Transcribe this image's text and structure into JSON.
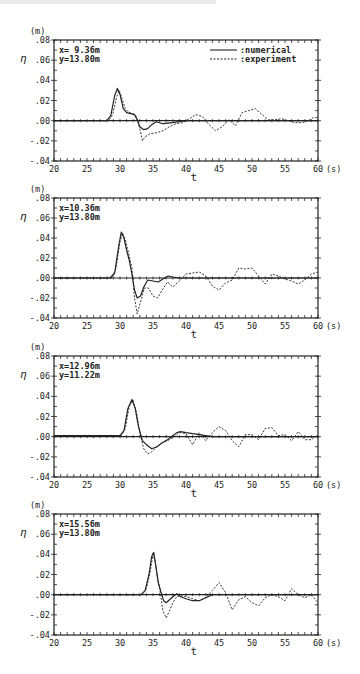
{
  "chart_data": [
    {
      "type": "line",
      "panel": 1,
      "annotation": [
        "x= 9.36m",
        "y=13.80m"
      ],
      "ylabel": "η",
      "yunit": "(m)",
      "xlabel": "t",
      "xunit": "(s)",
      "xlim": [
        20,
        60
      ],
      "ylim": [
        -0.04,
        0.08
      ],
      "xticks": [
        20,
        25,
        30,
        35,
        40,
        45,
        50,
        55,
        60
      ],
      "ytick_labels": [
        ".08",
        ".06",
        ".04",
        ".02",
        ".00",
        "-.02",
        "-.04"
      ],
      "yticks": [
        0.08,
        0.06,
        0.04,
        0.02,
        0.0,
        -0.02,
        -0.04
      ],
      "legend": [
        {
          "label": ":numerical",
          "style": "solid"
        },
        {
          "label": ":experiment",
          "style": "dashed"
        }
      ],
      "legend_position": "upper right",
      "series": [
        {
          "name": "numerical",
          "style": "solid",
          "x": [
            20,
            28,
            28.6,
            29.2,
            29.6,
            30.0,
            30.5,
            31.0,
            31.6,
            32.2,
            32.6,
            33.0,
            33.6,
            34.2,
            34.8,
            35.5,
            36.5,
            38,
            40,
            42,
            44,
            46,
            48,
            50,
            52,
            54,
            56,
            58,
            60
          ],
          "y": [
            0.0,
            0.0,
            0.005,
            0.025,
            0.032,
            0.026,
            0.012,
            0.008,
            0.007,
            0.006,
            0.001,
            -0.006,
            -0.009,
            -0.008,
            -0.004,
            -0.001,
            -0.003,
            -0.002,
            0.0,
            0.0,
            0.0,
            0.0,
            0.0,
            0.0,
            0.0,
            0.0,
            0.0,
            0.0,
            0.0
          ]
        },
        {
          "name": "experiment",
          "style": "dashed",
          "x": [
            20,
            28.3,
            28.9,
            29.5,
            29.9,
            30.3,
            30.8,
            31.4,
            32.0,
            32.5,
            33.0,
            33.4,
            33.8,
            34.5,
            35.5,
            36.5,
            37.5,
            38.5,
            39.5,
            40.5,
            41.5,
            42.5,
            43.5,
            44.5,
            45.5,
            46.5,
            47.5,
            48.5,
            49.5,
            50.5,
            51.5,
            52.5,
            53.5,
            54.5,
            55.5,
            56.5,
            57.5,
            58.5,
            59.3,
            60
          ],
          "y": [
            0.0,
            0.0,
            0.006,
            0.024,
            0.03,
            0.022,
            0.012,
            0.008,
            0.007,
            0.004,
            -0.008,
            -0.02,
            -0.016,
            -0.013,
            -0.012,
            -0.01,
            -0.006,
            -0.003,
            -0.002,
            0.002,
            0.006,
            0.004,
            -0.004,
            -0.01,
            -0.006,
            0.001,
            -0.005,
            0.008,
            0.01,
            0.012,
            0.006,
            0.001,
            0.001,
            0.002,
            0.0,
            -0.002,
            -0.002,
            0.0,
            0.003,
            0.003
          ]
        }
      ]
    },
    {
      "type": "line",
      "panel": 2,
      "annotation": [
        "x=10.36m",
        "y=13.80m"
      ],
      "ylabel": "η",
      "yunit": "(m)",
      "xlabel": "t",
      "xunit": "(s)",
      "xlim": [
        20,
        60
      ],
      "ylim": [
        -0.04,
        0.08
      ],
      "xticks": [
        20,
        25,
        30,
        35,
        40,
        45,
        50,
        55,
        60
      ],
      "ytick_labels": [
        ".08",
        ".06",
        ".04",
        ".02",
        ".00",
        "-.02",
        "-.04"
      ],
      "yticks": [
        0.08,
        0.06,
        0.04,
        0.02,
        0.0,
        -0.02,
        -0.04
      ],
      "series": [
        {
          "name": "numerical",
          "style": "solid",
          "x": [
            20,
            28.5,
            29.2,
            29.8,
            30.2,
            30.6,
            31.0,
            31.4,
            31.8,
            32.2,
            32.6,
            33.1,
            33.6,
            34.2,
            35.0,
            35.8,
            36.5,
            37.3,
            38,
            39,
            40,
            44,
            48,
            52,
            56,
            60
          ],
          "y": [
            0.0,
            0.0,
            0.005,
            0.032,
            0.046,
            0.04,
            0.028,
            0.018,
            0.004,
            -0.012,
            -0.02,
            -0.018,
            -0.009,
            -0.002,
            -0.003,
            -0.004,
            -0.001,
            0.002,
            0.001,
            0.0,
            0.0,
            0.0,
            0.0,
            0.0,
            0.0,
            0.0
          ]
        },
        {
          "name": "experiment",
          "style": "dashed",
          "x": [
            20,
            28.8,
            29.4,
            30.0,
            30.4,
            30.8,
            31.3,
            31.8,
            32.2,
            32.6,
            33.1,
            33.7,
            34.3,
            35.0,
            35.7,
            36.4,
            37.2,
            38,
            39,
            40,
            41,
            42,
            43,
            44,
            45,
            46,
            47,
            48,
            49,
            50,
            51,
            52,
            53,
            54,
            55,
            56,
            57,
            58,
            59,
            60
          ],
          "y": [
            0.0,
            0.0,
            0.01,
            0.036,
            0.045,
            0.038,
            0.025,
            0.01,
            -0.02,
            -0.036,
            -0.024,
            -0.01,
            -0.01,
            -0.018,
            -0.02,
            -0.012,
            -0.004,
            -0.009,
            -0.003,
            0.004,
            0.005,
            0.006,
            0.002,
            -0.008,
            -0.012,
            -0.005,
            -0.002,
            0.01,
            0.009,
            0.01,
            0.002,
            -0.006,
            0.004,
            0.002,
            -0.001,
            -0.003,
            -0.006,
            -0.002,
            0.004,
            0.006
          ]
        }
      ]
    },
    {
      "type": "line",
      "panel": 3,
      "annotation": [
        "x=12.96m",
        "y=11.22m"
      ],
      "ylabel": "η",
      "yunit": "(m)",
      "xlabel": "t",
      "xunit": "(s)",
      "xlim": [
        20,
        60
      ],
      "ylim": [
        -0.04,
        0.08
      ],
      "xticks": [
        20,
        25,
        30,
        35,
        40,
        45,
        50,
        55,
        60
      ],
      "ytick_labels": [
        ".08",
        ".06",
        ".04",
        ".02",
        ".00",
        "-.02",
        "-.04"
      ],
      "yticks": [
        0.08,
        0.06,
        0.04,
        0.02,
        0.0,
        -0.02,
        -0.04
      ],
      "series": [
        {
          "name": "numerical",
          "style": "solid",
          "x": [
            20,
            30,
            30.6,
            31.2,
            31.8,
            32.3,
            32.8,
            33.4,
            34.0,
            34.8,
            35.6,
            36.4,
            37.2,
            38.0,
            38.6,
            39.2,
            40,
            44,
            48,
            52,
            56,
            60
          ],
          "y": [
            0.001,
            0.001,
            0.006,
            0.028,
            0.037,
            0.028,
            0.01,
            -0.004,
            -0.008,
            -0.012,
            -0.01,
            -0.006,
            -0.003,
            0.001,
            0.004,
            0.005,
            0.004,
            0.0,
            0.0,
            0.0,
            0.0,
            0.0
          ]
        },
        {
          "name": "experiment",
          "style": "dashed",
          "x": [
            20,
            30.2,
            30.8,
            31.4,
            32.0,
            32.5,
            33.0,
            33.6,
            34.2,
            34.8,
            35.6,
            36.4,
            37.2,
            38.0,
            39.0,
            40,
            41,
            42,
            43,
            44,
            45,
            46,
            47,
            48,
            49,
            50,
            51,
            52,
            53,
            54,
            55,
            56,
            57,
            58,
            59,
            60
          ],
          "y": [
            0.001,
            0.001,
            0.008,
            0.03,
            0.036,
            0.024,
            0.004,
            -0.012,
            -0.017,
            -0.015,
            -0.01,
            -0.006,
            -0.004,
            -0.001,
            0.004,
            0.003,
            -0.008,
            0.004,
            -0.004,
            0.004,
            0.01,
            0.006,
            -0.004,
            -0.01,
            0.002,
            0.002,
            -0.003,
            0.008,
            0.009,
            0.001,
            0.002,
            -0.004,
            0.005,
            -0.003,
            -0.003,
            0.002
          ]
        }
      ]
    },
    {
      "type": "line",
      "panel": 4,
      "annotation": [
        "x=15.56m",
        "y=13.80m"
      ],
      "ylabel": "η",
      "yunit": "(m)",
      "xlabel": "t",
      "xunit": "(s)",
      "xlim": [
        20,
        60
      ],
      "ylim": [
        -0.04,
        0.08
      ],
      "xticks": [
        20,
        25,
        30,
        35,
        40,
        45,
        50,
        55,
        60
      ],
      "ytick_labels": [
        ".08",
        ".06",
        ".04",
        ".02",
        ".00",
        "-.02",
        "-.04"
      ],
      "yticks": [
        0.08,
        0.06,
        0.04,
        0.02,
        0.0,
        -0.02,
        -0.04
      ],
      "series": [
        {
          "name": "numerical",
          "style": "solid",
          "x": [
            20,
            33.2,
            33.8,
            34.4,
            34.8,
            35.1,
            35.4,
            35.8,
            36.2,
            36.6,
            37.0,
            37.5,
            38.0,
            38.6,
            39.2,
            40,
            41,
            42,
            43,
            44,
            48,
            52,
            56,
            60
          ],
          "y": [
            0.0,
            0.0,
            0.004,
            0.02,
            0.038,
            0.042,
            0.03,
            0.012,
            0.003,
            -0.006,
            -0.008,
            -0.005,
            -0.002,
            0.001,
            -0.002,
            -0.004,
            -0.006,
            -0.006,
            -0.003,
            0.0,
            0.0,
            0.0,
            0.0,
            0.0
          ]
        },
        {
          "name": "experiment",
          "style": "dashed",
          "x": [
            20,
            33.4,
            34.0,
            34.6,
            35.0,
            35.3,
            35.7,
            36.1,
            36.5,
            37.0,
            37.5,
            38.0,
            38.6,
            39.2,
            40,
            41,
            42,
            43,
            44,
            45,
            46,
            47,
            48,
            49,
            50,
            51,
            52,
            53,
            54,
            55,
            56,
            57,
            58,
            59,
            60
          ],
          "y": [
            0.0,
            0.0,
            0.006,
            0.024,
            0.04,
            0.034,
            0.016,
            0.002,
            -0.016,
            -0.023,
            -0.016,
            -0.008,
            -0.002,
            -0.001,
            -0.002,
            -0.004,
            -0.006,
            -0.003,
            0.004,
            0.012,
            0.002,
            -0.015,
            -0.005,
            -0.002,
            -0.008,
            -0.011,
            -0.003,
            0.0,
            -0.002,
            -0.006,
            0.006,
            0.0,
            -0.003,
            0.0,
            -0.008
          ]
        }
      ]
    }
  ],
  "figure": {
    "legend": {
      "numerical_label": ":numerical",
      "experiment_label": ":experiment"
    },
    "panels": [
      {
        "unit_label": "(m)",
        "eta_label": "η",
        "x_label": "t",
        "x_unit": "(s)",
        "loc_x": "x= 9.36m",
        "loc_y": "y=13.80m"
      },
      {
        "unit_label": "(m)",
        "eta_label": "η",
        "x_label": "t",
        "x_unit": "(s)",
        "loc_x": "x=10.36m",
        "loc_y": "y=13.80m"
      },
      {
        "unit_label": "(m)",
        "eta_label": "η",
        "x_label": "t",
        "x_unit": "(s)",
        "loc_x": "x=12.96m",
        "loc_y": "y=11.22m"
      },
      {
        "unit_label": "(m)",
        "eta_label": "η",
        "x_label": "t",
        "x_unit": "(s)",
        "loc_x": "x=15.56m",
        "loc_y": "y=13.80m"
      }
    ],
    "colors": {
      "ink": "#222222",
      "background": "#ffffff"
    }
  }
}
